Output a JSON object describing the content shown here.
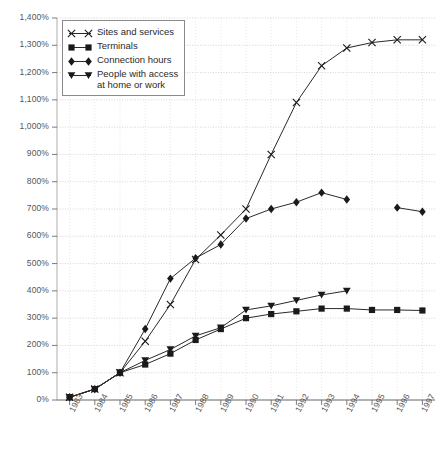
{
  "chart_data": {
    "type": "line",
    "title": "",
    "xlabel": "",
    "ylabel": "",
    "categories": [
      "1983",
      "1984",
      "1985",
      "1986",
      "1987",
      "1988",
      "1989",
      "1990",
      "1991",
      "1992",
      "1993",
      "1994",
      "1995",
      "1996",
      "1997"
    ],
    "ylim": [
      0,
      1400
    ],
    "yticks": [
      0,
      100,
      200,
      300,
      400,
      500,
      600,
      700,
      800,
      900,
      1000,
      1100,
      1200,
      1300,
      1400
    ],
    "ytick_labels": [
      "0%",
      "100%",
      "200%",
      "300%",
      "400%",
      "500%",
      "600%",
      "700%",
      "800%",
      "900%",
      "1,000%",
      "1,100%",
      "1,200%",
      "1,300%",
      "1,400%"
    ],
    "grid": true,
    "legend_position": "top-left",
    "value_unit": "%",
    "series": [
      {
        "name": "Sites and services",
        "marker": "cross",
        "values": [
          10,
          40,
          100,
          215,
          350,
          515,
          605,
          700,
          900,
          1090,
          1225,
          1290,
          1310,
          1320,
          1320
        ]
      },
      {
        "name": "Terminals",
        "marker": "square",
        "values": [
          10,
          40,
          100,
          130,
          170,
          220,
          260,
          300,
          315,
          325,
          335,
          335,
          330,
          330,
          328
        ]
      },
      {
        "name": "Connection hours",
        "marker": "diamond",
        "values": [
          10,
          40,
          100,
          260,
          445,
          520,
          570,
          665,
          700,
          725,
          760,
          735,
          null,
          705,
          690
        ]
      },
      {
        "name": "People with access at home or work",
        "marker": "triangle-down",
        "values": [
          10,
          40,
          100,
          145,
          185,
          235,
          265,
          330,
          345,
          365,
          385,
          400,
          null,
          null,
          null
        ]
      }
    ]
  },
  "legend": {
    "items": [
      {
        "label": "Sites and services"
      },
      {
        "label": "Terminals"
      },
      {
        "label": "Connection hours"
      },
      {
        "label": "People with access\nat home or work"
      }
    ]
  }
}
